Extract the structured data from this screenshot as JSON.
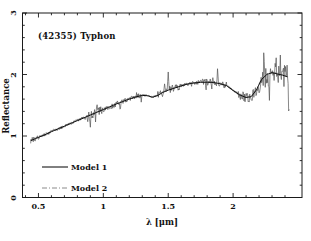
{
  "figure": {
    "background": "#ffffff",
    "frame_color": "#1a1a1a",
    "text_color": "#111111"
  },
  "chart_data": {
    "type": "line",
    "title": "(42355) Typhon",
    "xlabel": "λ [μm]",
    "ylabel": "Reflectance",
    "xlim": [
      0.377,
      2.531
    ],
    "ylim": [
      0,
      3
    ],
    "grid": false,
    "x_major_ticks": [
      0.5,
      1.0,
      1.5,
      2.0
    ],
    "x_tick_labels": [
      "0.5",
      "1",
      "1.5",
      "2"
    ],
    "x_minor_step": 0.1,
    "y_major_ticks": [
      0,
      1,
      2,
      3
    ],
    "y_tick_labels": [
      "0",
      "1",
      "2",
      "3"
    ],
    "y_minor_step": 0.2,
    "legend_position": "lower-left",
    "legend": [
      {
        "label": "Model 1",
        "style": "solid",
        "color": "#000000"
      },
      {
        "label": "Model 2",
        "style": "dash-dot",
        "color": "#8a8a8a"
      }
    ],
    "series": [
      {
        "name": "observed-spectrum",
        "color": "#555555",
        "style": "noisy-line",
        "x_range": [
          0.44,
          2.435
        ],
        "note": "noisy measured reflectance spectrum hugging the models",
        "noise_envelope": [
          [
            0.44,
            0.5,
            0.045
          ],
          [
            0.5,
            0.85,
            0.025
          ],
          [
            0.85,
            1.0,
            0.065
          ],
          [
            1.0,
            1.3,
            0.045
          ],
          [
            1.3,
            1.42,
            0.008
          ],
          [
            1.42,
            1.6,
            0.065
          ],
          [
            1.6,
            1.74,
            0.03
          ],
          [
            1.74,
            1.95,
            0.055
          ],
          [
            1.95,
            2.04,
            0.015
          ],
          [
            2.04,
            2.2,
            0.085
          ],
          [
            2.2,
            2.38,
            0.15
          ],
          [
            2.38,
            2.435,
            0.2
          ]
        ],
        "spikes": [
          [
            0.9,
            -0.18
          ],
          [
            0.95,
            0.14
          ],
          [
            1.13,
            -0.12
          ],
          [
            1.47,
            0.1
          ],
          [
            1.5,
            0.28
          ],
          [
            1.88,
            0.26
          ],
          [
            2.24,
            0.35
          ],
          [
            2.28,
            -0.3
          ],
          [
            2.33,
            0.25
          ],
          [
            2.43,
            -0.55
          ]
        ]
      },
      {
        "name": "Model 1",
        "color": "#000000",
        "style": "solid",
        "points": [
          [
            0.44,
            0.925
          ],
          [
            0.48,
            0.96
          ],
          [
            0.52,
            0.995
          ],
          [
            0.56,
            1.03
          ],
          [
            0.6,
            1.07
          ],
          [
            0.65,
            1.115
          ],
          [
            0.7,
            1.16
          ],
          [
            0.75,
            1.205
          ],
          [
            0.8,
            1.25
          ],
          [
            0.85,
            1.295
          ],
          [
            0.9,
            1.34
          ],
          [
            0.95,
            1.385
          ],
          [
            1.0,
            1.43
          ],
          [
            1.05,
            1.475
          ],
          [
            1.1,
            1.52
          ],
          [
            1.15,
            1.56
          ],
          [
            1.2,
            1.6
          ],
          [
            1.25,
            1.635
          ],
          [
            1.3,
            1.66
          ],
          [
            1.34,
            1.655
          ],
          [
            1.38,
            1.63
          ],
          [
            1.42,
            1.66
          ],
          [
            1.46,
            1.71
          ],
          [
            1.5,
            1.745
          ],
          [
            1.55,
            1.78
          ],
          [
            1.6,
            1.815
          ],
          [
            1.65,
            1.845
          ],
          [
            1.7,
            1.862
          ],
          [
            1.75,
            1.872
          ],
          [
            1.8,
            1.875
          ],
          [
            1.85,
            1.87
          ],
          [
            1.9,
            1.85
          ],
          [
            1.95,
            1.82
          ],
          [
            2.0,
            1.74
          ],
          [
            2.05,
            1.67
          ],
          [
            2.1,
            1.625
          ],
          [
            2.14,
            1.64
          ],
          [
            2.18,
            1.75
          ],
          [
            2.22,
            1.92
          ],
          [
            2.26,
            2.0
          ],
          [
            2.3,
            2.03
          ],
          [
            2.34,
            2.01
          ],
          [
            2.38,
            1.99
          ],
          [
            2.42,
            1.96
          ]
        ]
      },
      {
        "name": "Model 2",
        "color": "#8a8a8a",
        "style": "dash-dot",
        "offset_from_model1": 0.012
      }
    ]
  }
}
